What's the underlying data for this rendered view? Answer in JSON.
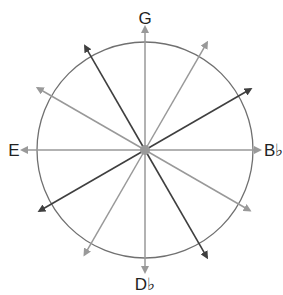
{
  "diagram": {
    "type": "radial-arrow-circle",
    "center": {
      "x": 145,
      "y": 150
    },
    "circle_radius": 108,
    "center_dot_radius": 5,
    "colors": {
      "circle": "#707070",
      "gray_arrow": "#999999",
      "dark_arrow": "#3f3f3f",
      "center_dot": "#9a9a9a",
      "label": "#222222"
    },
    "labels": {
      "top": "G",
      "left": "E",
      "right": "B♭",
      "bottom": "D♭"
    },
    "arrows": [
      {
        "angle_deg": 90,
        "length": 123,
        "tone": "gray",
        "labeled": "G"
      },
      {
        "angle_deg": 60,
        "length": 124,
        "tone": "gray"
      },
      {
        "angle_deg": 30,
        "length": 122,
        "tone": "dark"
      },
      {
        "angle_deg": 0,
        "length": 115,
        "tone": "gray",
        "labeled": "B♭"
      },
      {
        "angle_deg": 330,
        "length": 121,
        "tone": "gray"
      },
      {
        "angle_deg": 300,
        "length": 124,
        "tone": "dark"
      },
      {
        "angle_deg": 270,
        "length": 122,
        "tone": "gray",
        "labeled": "D♭"
      },
      {
        "angle_deg": 240,
        "length": 121,
        "tone": "gray"
      },
      {
        "angle_deg": 210,
        "length": 122,
        "tone": "dark"
      },
      {
        "angle_deg": 180,
        "length": 123,
        "tone": "gray",
        "labeled": "E"
      },
      {
        "angle_deg": 150,
        "length": 124,
        "tone": "gray"
      },
      {
        "angle_deg": 120,
        "length": 120,
        "tone": "dark"
      }
    ]
  }
}
